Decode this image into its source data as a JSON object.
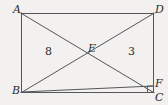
{
  "figure": {
    "kind": "plane-geometry-diagram",
    "shape": "rectangle-with-diagonals",
    "background_color": "#f2f1ef",
    "line_color": "#55555a",
    "text_color": "#2b2b2b",
    "vertices": [
      {
        "id": "A",
        "label": "A",
        "x": 21,
        "y": 13
      },
      {
        "id": "D",
        "label": "D",
        "x": 154,
        "y": 13
      },
      {
        "id": "B",
        "label": "B",
        "x": 21,
        "y": 92
      },
      {
        "id": "C",
        "label": "C",
        "x": 154,
        "y": 92
      },
      {
        "id": "F",
        "label": "F",
        "x": 154,
        "y": 86
      },
      {
        "id": "E",
        "label": "E",
        "x": 88,
        "y": 53
      }
    ],
    "segments": [
      {
        "name": "side-AD",
        "from": "A",
        "to": "D"
      },
      {
        "name": "side-AB",
        "from": "A",
        "to": "B"
      },
      {
        "name": "side-BC",
        "from": "B",
        "to": "C"
      },
      {
        "name": "side-DC",
        "from": "D",
        "to": "C"
      },
      {
        "name": "diagonal-AC",
        "from": "A",
        "to": "C"
      },
      {
        "name": "diagonal-BD",
        "from": "B",
        "to": "D"
      },
      {
        "name": "segment-BF",
        "from": "B",
        "to": "F"
      }
    ],
    "right_angle_marks": [
      {
        "name": "right-angle-at-F",
        "x": 154,
        "y": 86
      }
    ],
    "region_labels": [
      {
        "name": "area-left",
        "text": "8",
        "x": 48,
        "y": 52
      },
      {
        "name": "area-right",
        "text": "3",
        "x": 131,
        "y": 52
      }
    ]
  },
  "labels": {
    "A": "A",
    "B": "B",
    "C": "C",
    "D": "D",
    "E": "E",
    "F": "F",
    "area_left": "8",
    "area_right": "3"
  }
}
